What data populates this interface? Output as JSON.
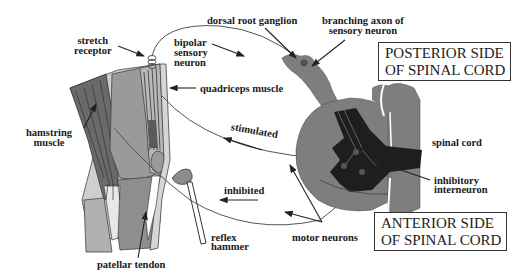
{
  "diagram": {
    "labels": {
      "stretch_receptor": [
        "stretch",
        "receptor"
      ],
      "bipolar_sensory_neuron": [
        "bipolar",
        "sensory",
        "neuron"
      ],
      "dorsal_root_ganglion": "dorsal root ganglion",
      "branching_axon": [
        "branching axon of",
        "sensory neuron"
      ],
      "quadriceps_muscle": "quadriceps muscle",
      "hamstring_muscle": [
        "hamstring",
        "muscle"
      ],
      "stimulated": "stimulated",
      "inhibited": "inhibited",
      "spinal_cord": "spinal cord",
      "inhibitory_interneuron": [
        "inhibitory",
        "interneuron"
      ],
      "motor_neurons": "motor neurons",
      "reflex_hammer": [
        "reflex",
        "hammer"
      ],
      "patellar_tendon": "patellar tendon"
    },
    "boxes": {
      "posterior": [
        "POSTERIOR SIDE",
        "OF SPINAL CORD"
      ],
      "anterior": [
        "ANTERIOR SIDE",
        "OF SPINAL CORD"
      ]
    },
    "colors": {
      "tissue_gray": "#8c8c8c",
      "dark_gray": "#5e5e5e",
      "light_gray": "#c4c4c4",
      "gray_matter": "#1e1e1e",
      "line": "#333333"
    }
  }
}
